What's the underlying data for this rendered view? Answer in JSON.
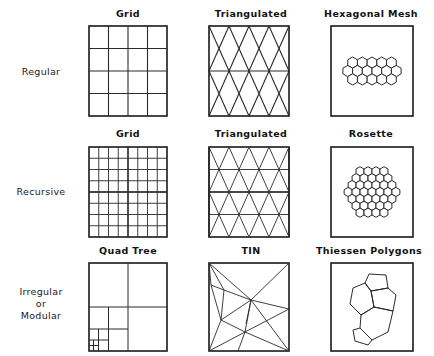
{
  "figure": {
    "background_color": "#ffffff",
    "line_color": "#2a2a2a",
    "rows": [
      {
        "label": "Regular"
      },
      {
        "label": "Recursive"
      },
      {
        "label": "Irregular\nor\nModular",
        "line1": "Irregular",
        "line2": "or",
        "line3": "Modular"
      }
    ],
    "cells": [
      {
        "title": "Grid",
        "type": "square-grid",
        "divisions": 4
      },
      {
        "title": "Triangulated",
        "type": "triangular-lattice",
        "rows": 2
      },
      {
        "title": "Hexagonal Mesh",
        "type": "hexagonal-mesh",
        "hex_rows": [
          5,
          6,
          5
        ]
      },
      {
        "title": "Grid",
        "type": "square-grid",
        "divisions": 8
      },
      {
        "title": "Triangulated",
        "type": "triangular-lattice",
        "rows": 4
      },
      {
        "title": "Rosette",
        "type": "hexagonal-rosette",
        "hex_rows": [
          4,
          5,
          6,
          7,
          6,
          5,
          4
        ]
      },
      {
        "title": "Quad Tree",
        "type": "quadtree",
        "levels": 4
      },
      {
        "title": "TIN",
        "type": "tin",
        "interior_points": 4
      },
      {
        "title": "Thiessen Polygons",
        "type": "thiessen-polygons",
        "polygon_count": 5
      }
    ]
  }
}
